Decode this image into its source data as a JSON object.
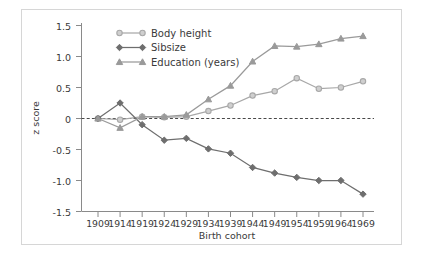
{
  "chart_data": {
    "type": "line",
    "title": "",
    "subtitle": "",
    "xlabel": "Birth cohort",
    "ylabel": "z score",
    "categories": [
      "1909",
      "1914",
      "1919",
      "1924",
      "1929",
      "1934",
      "1939",
      "1944",
      "1949",
      "1954",
      "1959",
      "1964",
      "1969"
    ],
    "x": [
      1909,
      1914,
      1919,
      1924,
      1929,
      1934,
      1939,
      1944,
      1949,
      1954,
      1959,
      1964,
      1969
    ],
    "xlim": [
      1909,
      1969
    ],
    "ylim": [
      -1.5,
      1.5
    ],
    "ytick_labels": [
      "1.5",
      "1.0",
      "0.5",
      "0",
      "-0.5",
      "-1.0",
      "-1.5"
    ],
    "ytick_values": [
      1.5,
      1.0,
      0.5,
      0,
      -0.5,
      -1.0,
      -1.5
    ],
    "grid": false,
    "zero_reference_line": 0,
    "legend_position": "top-left",
    "series": [
      {
        "name": "Body height",
        "marker": "circle",
        "color": "#a8a8a8",
        "values": [
          0.0,
          -0.02,
          0.03,
          0.02,
          0.03,
          0.12,
          0.21,
          0.37,
          0.44,
          0.65,
          0.48,
          0.5,
          0.6
        ]
      },
      {
        "name": "Sibsize",
        "marker": "diamond",
        "color": "#6e6e6e",
        "values": [
          0.0,
          0.25,
          -0.1,
          -0.35,
          -0.32,
          -0.49,
          -0.56,
          -0.79,
          -0.88,
          -0.95,
          -1.0,
          -1.0,
          -1.22
        ]
      },
      {
        "name": "Education (years)",
        "marker": "triangle",
        "color": "#9a9a9a",
        "values": [
          0.0,
          -0.15,
          0.03,
          0.03,
          0.06,
          0.31,
          0.53,
          0.92,
          1.17,
          1.16,
          1.2,
          1.29,
          1.33
        ]
      }
    ]
  },
  "legend": {
    "items": [
      {
        "label": "Body height"
      },
      {
        "label": "Sibsize"
      },
      {
        "label": "Education (years)"
      }
    ]
  },
  "axes": {
    "y_title": "z score",
    "x_title": "Birth cohort",
    "y_ticks": [
      "1.5",
      "1.0",
      "0.5",
      "0",
      "-0.5",
      "-1.0",
      "-1.5"
    ],
    "x_ticks": [
      "1909",
      "1914",
      "1919",
      "1924",
      "1929",
      "1934",
      "1939",
      "1944",
      "1949",
      "1954",
      "1959",
      "1964",
      "1969"
    ]
  },
  "style": {
    "frame_color": "#d6d6d6",
    "axis_color": "#8a8a8a",
    "text_color": "#3a3a3a",
    "background": "#ffffff"
  }
}
